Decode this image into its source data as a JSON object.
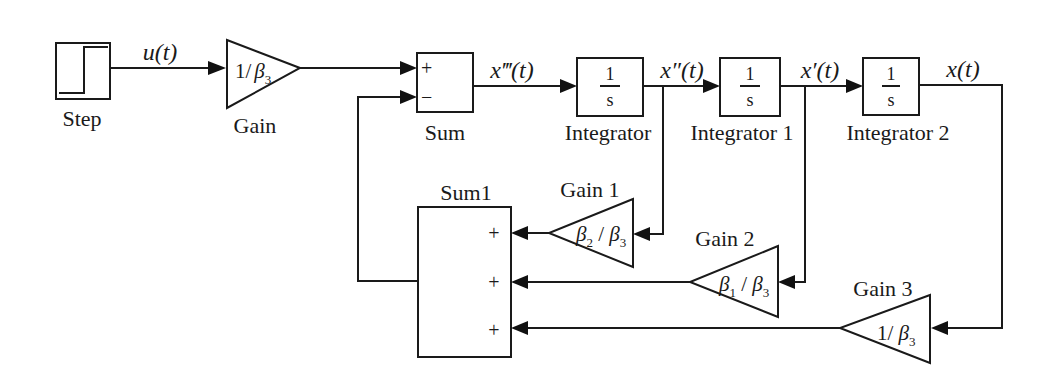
{
  "diagram": {
    "type": "simulink-block-diagram",
    "blocks": {
      "step": {
        "label": "Step"
      },
      "gain": {
        "label": "Gain",
        "value_num": "1/",
        "value_beta": "β",
        "value_sub": "3"
      },
      "sum": {
        "label": "Sum",
        "signs": [
          "+",
          "−"
        ]
      },
      "integrator": {
        "label": "Integrator",
        "num": "1",
        "den": "s"
      },
      "integrator1": {
        "label": "Integrator 1",
        "num": "1",
        "den": "s"
      },
      "integrator2": {
        "label": "Integrator 2",
        "num": "1",
        "den": "s"
      },
      "sum1": {
        "label": "Sum1",
        "signs": [
          "+",
          "+",
          "+"
        ]
      },
      "gain1": {
        "label": "Gain 1",
        "beta_a": "β",
        "sub_a": "2",
        "slash": " / ",
        "beta_b": "β",
        "sub_b": "3"
      },
      "gain2": {
        "label": "Gain 2",
        "beta_a": "β",
        "sub_a": "1",
        "slash": " / ",
        "beta_b": "β",
        "sub_b": "3"
      },
      "gain3": {
        "label": "Gain 3",
        "value_num": "1/ ",
        "beta": "β",
        "sub": "3"
      }
    },
    "signals": {
      "u": "u(t)",
      "x3": "x‴(t)",
      "x2": "x″(t)",
      "x1": "x′(t)",
      "x0": "x(t)"
    }
  }
}
